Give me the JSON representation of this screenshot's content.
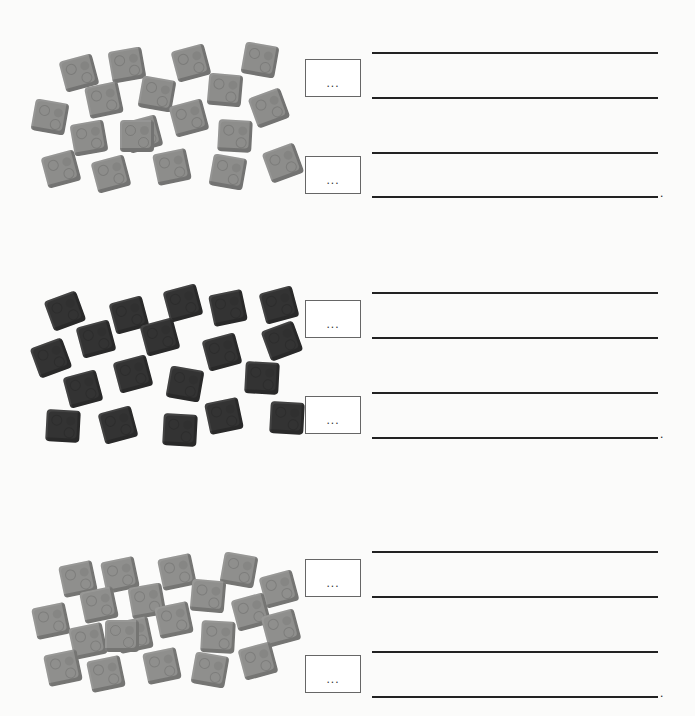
{
  "worksheet": {
    "groups": [
      {
        "name": "light-gray-blocks",
        "color": "#8d8d8b",
        "count": 19,
        "box_top": "...",
        "box_bottom": "...",
        "blocks": [
          [
            62,
            57,
            -15
          ],
          [
            110,
            49,
            -10
          ],
          [
            174,
            47,
            -15
          ],
          [
            243,
            44,
            10
          ],
          [
            87,
            84,
            -12
          ],
          [
            140,
            78,
            10
          ],
          [
            208,
            74,
            5
          ],
          [
            252,
            92,
            -20
          ],
          [
            33,
            101,
            10
          ],
          [
            172,
            102,
            -15
          ],
          [
            72,
            122,
            -10
          ],
          [
            126,
            118,
            -15
          ],
          [
            218,
            120,
            3
          ],
          [
            44,
            153,
            -15
          ],
          [
            94,
            158,
            -15
          ],
          [
            155,
            151,
            -12
          ],
          [
            211,
            156,
            10
          ],
          [
            266,
            147,
            -20
          ],
          [
            120,
            120,
            0
          ]
        ]
      },
      {
        "name": "dark-blocks",
        "color": "#333333",
        "count": 18,
        "box_top": "...",
        "box_bottom": "...",
        "blocks": [
          [
            48,
            295,
            -20
          ],
          [
            112,
            299,
            -15
          ],
          [
            166,
            287,
            -15
          ],
          [
            211,
            292,
            -12
          ],
          [
            262,
            289,
            -15
          ],
          [
            79,
            323,
            -15
          ],
          [
            143,
            321,
            -15
          ],
          [
            205,
            336,
            -15
          ],
          [
            265,
            325,
            -20
          ],
          [
            34,
            342,
            -20
          ],
          [
            116,
            358,
            -15
          ],
          [
            168,
            368,
            10
          ],
          [
            245,
            362,
            3
          ],
          [
            66,
            373,
            -15
          ],
          [
            46,
            410,
            3
          ],
          [
            101,
            409,
            -15
          ],
          [
            163,
            414,
            3
          ],
          [
            207,
            400,
            -12
          ],
          [
            270,
            402,
            3
          ]
        ]
      },
      {
        "name": "gray-blocks",
        "color": "#8f8f8d",
        "count": 21,
        "box_top": "...",
        "box_bottom": "...",
        "blocks": [
          [
            61,
            563,
            -12
          ],
          [
            103,
            559,
            -12
          ],
          [
            160,
            556,
            -12
          ],
          [
            222,
            554,
            10
          ],
          [
            262,
            573,
            -15
          ],
          [
            82,
            589,
            -12
          ],
          [
            130,
            585,
            -10
          ],
          [
            191,
            580,
            5
          ],
          [
            234,
            596,
            -15
          ],
          [
            264,
            612,
            -15
          ],
          [
            34,
            605,
            -12
          ],
          [
            157,
            604,
            -12
          ],
          [
            71,
            625,
            -12
          ],
          [
            117,
            619,
            -12
          ],
          [
            201,
            621,
            3
          ],
          [
            46,
            652,
            -12
          ],
          [
            89,
            658,
            -12
          ],
          [
            145,
            650,
            -12
          ],
          [
            193,
            654,
            10
          ],
          [
            241,
            645,
            -15
          ],
          [
            105,
            620,
            0
          ]
        ]
      }
    ]
  }
}
